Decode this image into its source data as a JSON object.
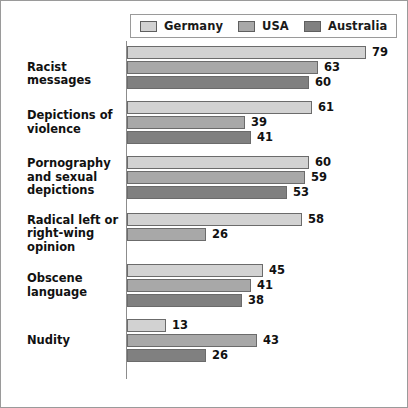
{
  "chart_data": {
    "type": "bar",
    "orientation": "horizontal",
    "title": "",
    "xlabel": "",
    "ylabel": "",
    "xlim": [
      0,
      79
    ],
    "grid": false,
    "legend_position": "top",
    "categories": [
      "Racist messages",
      "Depictions of violence",
      "Pornography and sexual depictions",
      "Radical left or right-wing opinion",
      "Obscene language",
      "Nudity"
    ],
    "series": [
      {
        "name": "Germany",
        "color": "#d2d2d2",
        "values": [
          79,
          61,
          60,
          58,
          45,
          13
        ]
      },
      {
        "name": "USA",
        "color": "#a8a8a8",
        "values": [
          63,
          39,
          59,
          26,
          41,
          43
        ]
      },
      {
        "name": "Australia",
        "color": "#808080",
        "values": [
          60,
          41,
          53,
          null,
          38,
          26
        ]
      }
    ]
  },
  "legend": {
    "entries": [
      {
        "label": "Germany",
        "color": "#d2d2d2"
      },
      {
        "label": "USA",
        "color": "#a8a8a8"
      },
      {
        "label": "Australia",
        "color": "#808080"
      }
    ]
  },
  "groups": [
    {
      "label_line1": "Racist messages",
      "label_line2": "",
      "bars": [
        {
          "series": "Germany",
          "value": "79",
          "color": "#d2d2d2"
        },
        {
          "series": "USA",
          "value": "63",
          "color": "#a8a8a8"
        },
        {
          "series": "Australia",
          "value": "60",
          "color": "#808080"
        }
      ]
    },
    {
      "label_line1": "Depictions of",
      "label_line2": "violence",
      "bars": [
        {
          "series": "Germany",
          "value": "61",
          "color": "#d2d2d2"
        },
        {
          "series": "USA",
          "value": "39",
          "color": "#a8a8a8"
        },
        {
          "series": "Australia",
          "value": "41",
          "color": "#808080"
        }
      ]
    },
    {
      "label_line1": "Pornography",
      "label_line2": "and sexual",
      "label_line3": "depictions",
      "bars": [
        {
          "series": "Germany",
          "value": "60",
          "color": "#d2d2d2"
        },
        {
          "series": "USA",
          "value": "59",
          "color": "#a8a8a8"
        },
        {
          "series": "Australia",
          "value": "53",
          "color": "#808080"
        }
      ]
    },
    {
      "label_line1": "Radical left or",
      "label_line2": "right-wing opinion",
      "bars": [
        {
          "series": "Germany",
          "value": "58",
          "color": "#d2d2d2"
        },
        {
          "series": "USA",
          "value": "26",
          "color": "#a8a8a8"
        }
      ]
    },
    {
      "label_line1": "Obscene",
      "label_line2": "language",
      "bars": [
        {
          "series": "Germany",
          "value": "45",
          "color": "#d2d2d2"
        },
        {
          "series": "USA",
          "value": "41",
          "color": "#a8a8a8"
        },
        {
          "series": "Australia",
          "value": "38",
          "color": "#808080"
        }
      ]
    },
    {
      "label_line1": "Nudity",
      "label_line2": "",
      "bars": [
        {
          "series": "Germany",
          "value": "13",
          "color": "#d2d2d2"
        },
        {
          "series": "USA",
          "value": "43",
          "color": "#a8a8a8"
        },
        {
          "series": "Australia",
          "value": "26",
          "color": "#808080"
        }
      ]
    }
  ]
}
